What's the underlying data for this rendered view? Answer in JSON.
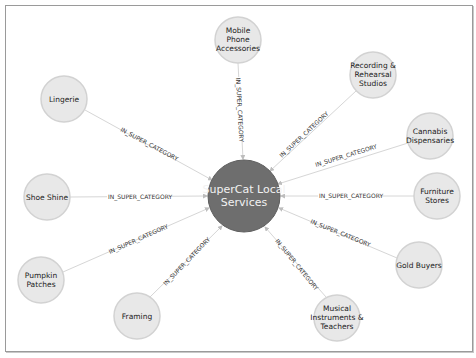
{
  "graph": {
    "center": {
      "label_lines": [
        "SuperCat Local",
        "Services"
      ],
      "color": "#6e6e6e"
    },
    "edge_label": "IN_SUPER_CATEGORY",
    "nodes": [
      {
        "id": "mobile",
        "label_lines": [
          "Mobile",
          "Phone",
          "Accessories"
        ]
      },
      {
        "id": "recording",
        "label_lines": [
          "Recording &",
          "Rehearsal",
          "Studios"
        ]
      },
      {
        "id": "cannabis",
        "label_lines": [
          "Cannabis",
          "Dispensaries"
        ]
      },
      {
        "id": "furniture",
        "label_lines": [
          "Furniture",
          "Stores"
        ]
      },
      {
        "id": "gold",
        "label_lines": [
          "Gold Buyers"
        ]
      },
      {
        "id": "musical",
        "label_lines": [
          "Musical",
          "Instruments &",
          "Teachers"
        ]
      },
      {
        "id": "framing",
        "label_lines": [
          "Framing"
        ]
      },
      {
        "id": "pumpkin",
        "label_lines": [
          "Pumpkin",
          "Patches"
        ]
      },
      {
        "id": "shoe",
        "label_lines": [
          "Shoe Shine"
        ]
      },
      {
        "id": "lingerie",
        "label_lines": [
          "Lingerie"
        ]
      }
    ],
    "leaf_color": "#e8e8e8"
  }
}
